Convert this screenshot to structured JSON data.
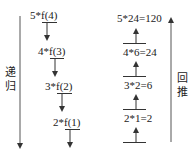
{
  "recursion": {
    "label_chars": [
      "递",
      "归"
    ],
    "steps": [
      {
        "prefix": "5*",
        "call": "f(4)"
      },
      {
        "prefix": "4*",
        "call": "f(3)"
      },
      {
        "prefix": "3*",
        "call": "f(2)"
      },
      {
        "prefix": "2*",
        "call": "f(1)"
      }
    ]
  },
  "backtrack": {
    "label_chars": [
      "回",
      "推"
    ],
    "steps": [
      {
        "expr": "5*24=120"
      },
      {
        "expr": "4*6=24"
      },
      {
        "expr": "3*2=6"
      },
      {
        "expr": "2*1=2"
      }
    ]
  },
  "colors": {
    "line": "#333333",
    "text": "#222222",
    "background": "#ffffff"
  }
}
